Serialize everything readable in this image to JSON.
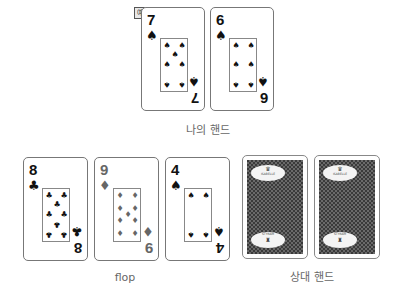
{
  "badge": {
    "text": "예"
  },
  "my_hand": {
    "label": "나의 핸드",
    "cards": [
      {
        "rank": "7",
        "suit": "♠",
        "suit_name": "spades",
        "color": "black"
      },
      {
        "rank": "6",
        "suit": "♠",
        "suit_name": "spades",
        "color": "black"
      }
    ]
  },
  "flop": {
    "label": "flop",
    "cards": [
      {
        "rank": "8",
        "suit": "♣",
        "suit_name": "clubs",
        "color": "black"
      },
      {
        "rank": "9",
        "suit": "♦",
        "suit_name": "diamonds",
        "color": "gray"
      },
      {
        "rank": "4",
        "suit": "♠",
        "suit_name": "spades",
        "color": "black"
      }
    ]
  },
  "opponent_hand": {
    "label": "상대 핸드",
    "cards": [
      {
        "face": "down",
        "brand_top": "ISABELLE",
        "brand_bottom": "STYRAM"
      },
      {
        "face": "down",
        "brand_top": "ISABELLE",
        "brand_bottom": "STYRAM"
      }
    ]
  },
  "colors": {
    "black": "#111111",
    "gray": "#666666",
    "card_back": "#3a3a3a"
  }
}
